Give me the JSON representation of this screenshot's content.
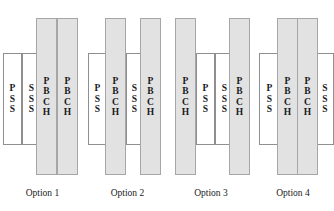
{
  "figure": {
    "colors": {
      "pbch_fill": "#e2e2e2",
      "pss_sss_fill": "#ffffff",
      "outline": "#9a9a9a",
      "text": "#1a1a1a",
      "background": "#ffffff"
    },
    "legend_note": "Tall shaded bars are PBCH; short white bars are PSS and SSS",
    "options": [
      {
        "caption": "Option 1",
        "bars": [
          {
            "label": "PSS",
            "type": "short",
            "x": 3,
            "width": 19
          },
          {
            "label": "SSS",
            "type": "short",
            "x": 22,
            "width": 19
          },
          {
            "label": "PBCH",
            "type": "tall",
            "x": 36,
            "width": 21
          },
          {
            "label": "PBCH",
            "type": "tall",
            "x": 57,
            "width": 21
          }
        ]
      },
      {
        "caption": "Option 2",
        "bars": [
          {
            "label": "PSS",
            "type": "short",
            "x": 88,
            "width": 19
          },
          {
            "label": "PBCH",
            "type": "tall",
            "x": 105,
            "width": 21
          },
          {
            "label": "SSS",
            "type": "short",
            "x": 126,
            "width": 17
          },
          {
            "label": "PBCH",
            "type": "tall",
            "x": 140,
            "width": 21
          }
        ]
      },
      {
        "caption": "Option 3",
        "bars": [
          {
            "label": "PBCH",
            "type": "tall",
            "x": 175,
            "width": 21
          },
          {
            "label": "PSS",
            "type": "short",
            "x": 196,
            "width": 19
          },
          {
            "label": "SSS",
            "type": "short",
            "x": 215,
            "width": 19
          },
          {
            "label": "PBCH",
            "type": "tall",
            "x": 229,
            "width": 21
          }
        ]
      },
      {
        "caption": "Option 4",
        "bars": [
          {
            "label": "PSS",
            "type": "short",
            "x": 259,
            "width": 21
          },
          {
            "label": "PBCH",
            "type": "tall",
            "x": 277,
            "width": 21
          },
          {
            "label": "PBCH",
            "type": "tall",
            "x": 297,
            "width": 21
          },
          {
            "label": "SSS",
            "type": "short",
            "x": 316,
            "width": 18
          }
        ]
      }
    ]
  }
}
